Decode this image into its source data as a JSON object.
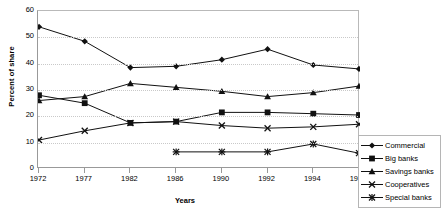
{
  "chart_data": {
    "type": "line",
    "title": "",
    "xlabel": "Years",
    "ylabel": "Percent of share",
    "categories": [
      "1972",
      "1977",
      "1982",
      "1986",
      "1990",
      "1992",
      "1994",
      "1996"
    ],
    "ylim": [
      0,
      60
    ],
    "yticks": [
      0,
      10,
      20,
      30,
      40,
      50,
      60
    ],
    "grid": true,
    "legend_position": "right",
    "series": [
      {
        "name": "Commercial",
        "marker": "diamond",
        "values": [
          54,
          48.5,
          38.5,
          39,
          41.5,
          45.5,
          39.5,
          38
        ]
      },
      {
        "name": "Big banks",
        "marker": "square",
        "values": [
          28,
          25,
          17.5,
          18,
          21.5,
          21.5,
          21,
          20.5
        ]
      },
      {
        "name": "Savings banks",
        "marker": "triangle",
        "values": [
          26,
          27.5,
          32.5,
          31,
          29.5,
          27.5,
          29,
          31.5
        ]
      },
      {
        "name": "Cooperatives",
        "marker": "x",
        "values": [
          11,
          14.5,
          17.5,
          18,
          16.5,
          15.5,
          16,
          17
        ]
      },
      {
        "name": "Special banks",
        "marker": "asterisk",
        "values": [
          null,
          null,
          null,
          6.5,
          6.5,
          6.5,
          9.5,
          6
        ]
      }
    ]
  },
  "legend": {
    "items": [
      {
        "label": "Commercial"
      },
      {
        "label": "Big banks"
      },
      {
        "label": "Savings banks"
      },
      {
        "label": "Cooperatives"
      },
      {
        "label": "Special banks"
      }
    ]
  },
  "colors": {
    "line": "#111111",
    "grid": "#c9c9c9",
    "axis": "#999999",
    "background": "#ffffff"
  }
}
